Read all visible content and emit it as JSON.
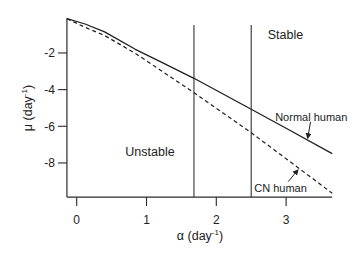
{
  "chart_data": {
    "type": "line",
    "title": "",
    "xlabel": "α (day⁻¹)",
    "ylabel": "μ (day⁻¹)",
    "xlim": [
      -0.14,
      3.66
    ],
    "ylim": [
      -9.86,
      -0.1
    ],
    "grid": false,
    "legend": null,
    "x_ticks": [
      0,
      1,
      2,
      3
    ],
    "y_ticks": [
      -2,
      -4,
      -6,
      -8
    ],
    "series": [
      {
        "name": "Normal human",
        "style": "solid",
        "points": [
          [
            -0.14,
            -0.13
          ],
          [
            0.12,
            -0.42
          ],
          [
            0.4,
            -0.85
          ],
          [
            0.84,
            -1.8
          ],
          [
            1.19,
            -2.46
          ],
          [
            1.68,
            -3.38
          ],
          [
            2.5,
            -5.07
          ],
          [
            3.0,
            -6.11
          ],
          [
            3.66,
            -7.49
          ]
        ]
      },
      {
        "name": "CN human",
        "style": "dashed",
        "points": [
          [
            -0.14,
            -0.13
          ],
          [
            0.12,
            -0.6
          ],
          [
            0.4,
            -1.05
          ],
          [
            0.84,
            -2.02
          ],
          [
            1.2,
            -2.94
          ],
          [
            1.68,
            -4.17
          ],
          [
            2.5,
            -6.35
          ],
          [
            3.0,
            -7.77
          ],
          [
            3.66,
            -9.65
          ]
        ]
      }
    ],
    "vertical_lines": [
      {
        "x": 1.68,
        "y_top": -0.475
      },
      {
        "x": 2.5,
        "y_top": -0.475
      }
    ],
    "annotations": [
      {
        "text": "Stable",
        "x": 2.99,
        "y": -1.02,
        "kind": "region"
      },
      {
        "text": "Unstable",
        "x": 1.05,
        "y": -7.4,
        "kind": "region"
      },
      {
        "text": "Normal human",
        "x": 3.36,
        "y": -5.47,
        "kind": "series",
        "arrow_from": [
          3.35,
          -5.76
        ],
        "arrow_to": [
          3.31,
          -6.65
        ]
      },
      {
        "text": "CN human",
        "x": 2.92,
        "y": -9.38,
        "kind": "series",
        "arrow_from": [
          3.03,
          -9.02
        ],
        "arrow_to": [
          3.17,
          -8.38
        ]
      }
    ]
  },
  "axes": {
    "x_label": {
      "main": "α (day",
      "sup": "-1",
      "close": ")"
    },
    "y_label": {
      "main": "μ (day",
      "sup": "-1",
      "close": ")"
    }
  }
}
